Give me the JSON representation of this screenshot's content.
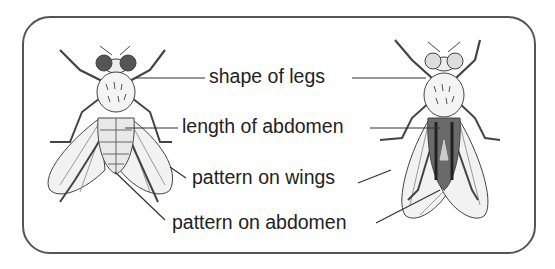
{
  "diagram": {
    "subjects": [
      {
        "name": "light fly",
        "position": "left",
        "abdomen": "pale, segmented"
      },
      {
        "name": "dark fly",
        "position": "right",
        "abdomen": "dark, striped"
      }
    ],
    "labels": [
      {
        "id": "legs",
        "text": "shape of legs"
      },
      {
        "id": "abdomen-length",
        "text": "length of abdomen"
      },
      {
        "id": "wings",
        "text": "pattern on wings"
      },
      {
        "id": "abdomen-pattern",
        "text": "pattern on abdomen"
      }
    ],
    "colors": {
      "line": "#333333",
      "frame": "#555555",
      "fly_light": "#e6e6e6",
      "fly_dark": "#555555"
    }
  }
}
